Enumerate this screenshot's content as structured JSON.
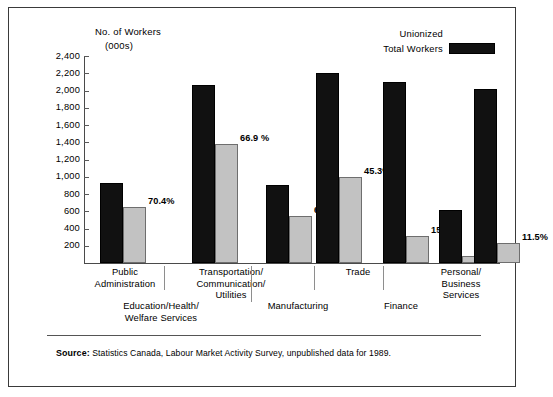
{
  "axis_title": {
    "line1": "No. of Workers",
    "line2": "(000s)"
  },
  "legend": {
    "items": [
      {
        "label": "Unionized",
        "color": "#c2c2c2",
        "key": "unionized"
      },
      {
        "label": "Total Workers",
        "color": "#111111",
        "key": "total"
      }
    ]
  },
  "y_ticks": [
    "2,400",
    "2,200",
    "2,000",
    "1,800",
    "1,600",
    "1,400",
    "1,200",
    "1,000",
    "800",
    "600",
    "400",
    "200"
  ],
  "source": {
    "label": "Source:",
    "text": " Statistics Canada, Labour Market Activity Survey, unpublished data for 1989."
  },
  "categories_display": [
    {
      "name": "cat-public-administration",
      "lines": [
        "Public",
        "Administration"
      ]
    },
    {
      "name": "cat-education-health-welfare-services",
      "lines": [
        "Education/Health/",
        "Welfare Services"
      ]
    },
    {
      "name": "cat-transportation-communication-utilities",
      "lines": [
        "Transportation/",
        "Communication/",
        "Utilities"
      ]
    },
    {
      "name": "cat-manufacturing",
      "lines": [
        "Manufacturing"
      ]
    },
    {
      "name": "cat-trade",
      "lines": [
        "Trade"
      ]
    },
    {
      "name": "cat-finance",
      "lines": [
        "Finance"
      ]
    },
    {
      "name": "cat-personal-business-services",
      "lines": [
        "Personal/",
        "Business",
        "Services"
      ]
    }
  ],
  "chart_data": {
    "type": "bar",
    "title": "",
    "xlabel": "",
    "ylabel": "No. of Workers (000s)",
    "ylim": [
      0,
      2400
    ],
    "ytick_step": 200,
    "grid": false,
    "legend_position": "top-right",
    "categories": [
      "Public Administration",
      "Education/Health/Welfare Services",
      "Transportation/Communication/Utilities",
      "Manufacturing",
      "Trade",
      "Finance",
      "Personal/Business Services"
    ],
    "series": [
      {
        "name": "Total Workers",
        "color": "#111111",
        "values": [
          930,
          2060,
          905,
          2200,
          2100,
          615,
          2020
        ]
      },
      {
        "name": "Unionized",
        "color": "#c2c2c2",
        "values": [
          655,
          1378,
          545,
          996,
          317,
          76,
          232
        ]
      }
    ],
    "annotations": [
      {
        "category": "Public Administration",
        "text": "70.4%"
      },
      {
        "category": "Education/Health/Welfare Services",
        "text": "66.9 %"
      },
      {
        "category": "Transportation/Communication/Utilities",
        "text": "60.2%"
      },
      {
        "category": "Manufacturing",
        "text": "45.3%"
      },
      {
        "category": "Trade",
        "text": "15.1%"
      },
      {
        "category": "Finance",
        "text": "12.4%"
      },
      {
        "category": "Personal/Business Services",
        "text": "11.5%"
      }
    ]
  }
}
